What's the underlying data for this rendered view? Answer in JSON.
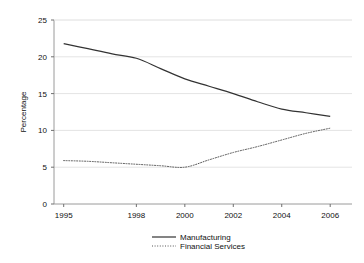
{
  "chart_data": {
    "type": "line",
    "title": "",
    "xlabel": "",
    "ylabel": "Percentage",
    "xlim": [
      1994.6,
      2006.9
    ],
    "ylim": [
      0,
      25
    ],
    "grid": true,
    "grid_axis": "y",
    "legend_position": "bottom-center",
    "xticks": [
      1995,
      1998,
      2000,
      2002,
      2004,
      2006
    ],
    "xticklabels": [
      "1995",
      "1998",
      "2000",
      "2002",
      "2004",
      "2006"
    ],
    "yticks": [
      0,
      5,
      10,
      15,
      20,
      25
    ],
    "yticklabels": [
      "0",
      "5",
      "10",
      "15",
      "20",
      "25"
    ],
    "x": [
      1995,
      1996,
      1997,
      1998,
      1999,
      2000,
      2001,
      2002,
      2003,
      2004,
      2005,
      2006
    ],
    "series": [
      {
        "name": "Manufacturing",
        "style": "solid",
        "color": "#333333",
        "values": [
          21.8,
          21.1,
          20.4,
          19.8,
          18.4,
          17.0,
          16.0,
          15.0,
          13.9,
          12.9,
          12.4,
          11.9
        ]
      },
      {
        "name": "Financial Services",
        "style": "dotted",
        "color": "#555555",
        "values": [
          5.9,
          5.8,
          5.6,
          5.4,
          5.2,
          5.0,
          6.0,
          7.0,
          7.8,
          8.7,
          9.6,
          10.3
        ]
      }
    ]
  },
  "legend": {
    "items": [
      {
        "label": "Manufacturing"
      },
      {
        "label": "Financial Services"
      }
    ]
  },
  "axis": {
    "y_title": "Percentage"
  }
}
